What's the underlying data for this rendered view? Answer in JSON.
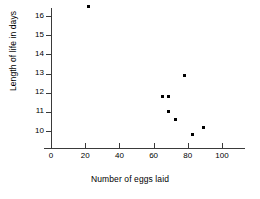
{
  "chart_data": {
    "type": "scatter",
    "title": "",
    "xlabel": "Number of eggs laid",
    "ylabel": "Length of life in days",
    "xlim": [
      0,
      110
    ],
    "ylim": [
      9.2,
      16.9
    ],
    "xticks": [
      0,
      20,
      40,
      60,
      80,
      100
    ],
    "yticks": [
      10,
      11,
      12,
      13,
      14,
      15,
      16
    ],
    "grid": false,
    "legend": null,
    "marker": "square",
    "marker_color": "#000000",
    "axis_color": "#3a3a3a",
    "points": [
      {
        "x": 22,
        "y": 16.5
      },
      {
        "x": 65,
        "y": 11.8
      },
      {
        "x": 69,
        "y": 11.8
      },
      {
        "x": 78,
        "y": 12.9
      },
      {
        "x": 69,
        "y": 11.0
      },
      {
        "x": 73,
        "y": 10.6
      },
      {
        "x": 83,
        "y": 9.8
      },
      {
        "x": 89,
        "y": 10.2
      }
    ],
    "x": [
      22,
      65,
      69,
      78,
      69,
      73,
      83,
      89
    ],
    "values": [
      16.5,
      11.8,
      11.8,
      12.9,
      11.0,
      10.6,
      9.8,
      10.2
    ]
  },
  "axes": {
    "y_tick_labels": [
      "16",
      "15",
      "14",
      "13",
      "12",
      "11",
      "10"
    ],
    "x_tick_labels": [
      "0",
      "20",
      "40",
      "60",
      "80",
      "100"
    ]
  }
}
